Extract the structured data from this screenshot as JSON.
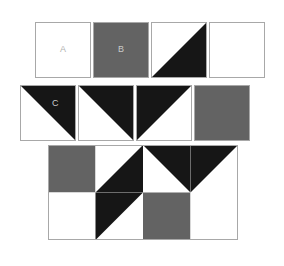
{
  "diagram": {
    "type": "patchwork-block",
    "colors": {
      "white": "#ffffff",
      "gray": "#636363",
      "black": "#161616",
      "outline": "#a8a8a8",
      "label_on_light": "#b0b0b0",
      "label_on_dark": "#c9c9c9",
      "background": "#ffffff"
    },
    "legend_rows": [
      {
        "row_name": "unit-row-1",
        "units": [
          {
            "id": "unit-a",
            "label": "A",
            "patch": "solid",
            "fill": "white",
            "label_color": "label_on_light"
          },
          {
            "id": "unit-b",
            "label": "B",
            "patch": "solid",
            "fill": "gray",
            "label_color": "label_on_dark"
          },
          {
            "id": "unit-c1",
            "label": "",
            "patch": "half-square-triangle",
            "dark_half": "lower-right",
            "fill": "black"
          },
          {
            "id": "unit-d",
            "label": "",
            "patch": "solid",
            "fill": "white"
          }
        ]
      },
      {
        "row_name": "unit-row-2",
        "units": [
          {
            "id": "unit-c",
            "label": "C",
            "patch": "half-square-triangle",
            "dark_half": "upper-right",
            "fill": "black",
            "label_color": "label_on_dark"
          },
          {
            "id": "unit-e",
            "label": "",
            "patch": "half-square-triangle",
            "dark_half": "upper-right",
            "fill": "black"
          },
          {
            "id": "unit-f",
            "label": "",
            "patch": "half-square-triangle",
            "dark_half": "upper-left",
            "fill": "black"
          },
          {
            "id": "unit-g",
            "label": "",
            "patch": "solid",
            "fill": "gray"
          }
        ]
      }
    ],
    "assembled_block": {
      "name": "assembled-quilt-block",
      "columns": 4,
      "rows": 2,
      "cells": [
        {
          "id": "cell-r1c1",
          "patch": "solid",
          "fill": "gray"
        },
        {
          "id": "cell-r1c2",
          "patch": "half-square-triangle",
          "dark_half": "lower-right",
          "fill": "black"
        },
        {
          "id": "cell-r1c3",
          "patch": "half-square-triangle",
          "dark_half": "upper-right",
          "fill": "black"
        },
        {
          "id": "cell-r1c4",
          "patch": "half-square-triangle",
          "dark_half": "upper-left",
          "fill": "black"
        },
        {
          "id": "cell-r2c1",
          "patch": "solid",
          "fill": "white"
        },
        {
          "id": "cell-r2c2",
          "patch": "half-square-triangle",
          "dark_half": "upper-left",
          "fill": "black"
        },
        {
          "id": "cell-r2c3",
          "patch": "solid",
          "fill": "gray"
        },
        {
          "id": "cell-r2c4",
          "patch": "solid",
          "fill": "white"
        }
      ]
    },
    "geometry": {
      "row1": {
        "x": 35,
        "y": 22,
        "size": 56,
        "gap": 2
      },
      "row2": {
        "x": 20,
        "y": 85,
        "size": 56,
        "gap": 2
      },
      "block": {
        "x": 48,
        "y": 145,
        "cell": 47.5
      }
    }
  }
}
